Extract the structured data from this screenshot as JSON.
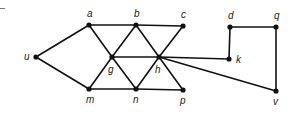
{
  "diagram": {
    "type": "graph",
    "nodes": [
      {
        "id": "u",
        "label": "u",
        "x": 36,
        "y": 57,
        "lx": 24,
        "ly": 60
      },
      {
        "id": "a",
        "label": "a",
        "x": 89,
        "y": 25,
        "lx": 87,
        "ly": 17
      },
      {
        "id": "b",
        "label": "b",
        "x": 136,
        "y": 25,
        "lx": 134,
        "ly": 17
      },
      {
        "id": "c",
        "label": "c",
        "x": 183,
        "y": 26,
        "lx": 181,
        "ly": 18
      },
      {
        "id": "d",
        "label": "d",
        "x": 230,
        "y": 27,
        "lx": 228,
        "ly": 19
      },
      {
        "id": "q",
        "label": "q",
        "x": 276,
        "y": 27,
        "lx": 274,
        "ly": 19
      },
      {
        "id": "g",
        "label": "g",
        "x": 112,
        "y": 57,
        "lx": 108,
        "ly": 73
      },
      {
        "id": "h",
        "label": "h",
        "x": 159,
        "y": 57,
        "lx": 155,
        "ly": 73
      },
      {
        "id": "k",
        "label": "k",
        "x": 229,
        "y": 59,
        "lx": 236,
        "ly": 63
      },
      {
        "id": "m",
        "label": "m",
        "x": 89,
        "y": 89,
        "lx": 86,
        "ly": 103
      },
      {
        "id": "n",
        "label": "n",
        "x": 136,
        "y": 89,
        "lx": 133,
        "ly": 103
      },
      {
        "id": "p",
        "label": "p",
        "x": 183,
        "y": 90,
        "lx": 180,
        "ly": 104
      },
      {
        "id": "v",
        "label": "v",
        "x": 276,
        "y": 91,
        "lx": 273,
        "ly": 105
      }
    ],
    "edges": [
      [
        "u",
        "a"
      ],
      [
        "u",
        "m"
      ],
      [
        "a",
        "b"
      ],
      [
        "b",
        "c"
      ],
      [
        "m",
        "n"
      ],
      [
        "n",
        "p"
      ],
      [
        "a",
        "g"
      ],
      [
        "g",
        "m"
      ],
      [
        "b",
        "g"
      ],
      [
        "g",
        "n"
      ],
      [
        "b",
        "h"
      ],
      [
        "h",
        "n"
      ],
      [
        "c",
        "h"
      ],
      [
        "h",
        "p"
      ],
      [
        "g",
        "h"
      ],
      [
        "h",
        "k"
      ],
      [
        "h",
        "v"
      ],
      [
        "d",
        "k"
      ],
      [
        "d",
        "q"
      ],
      [
        "q",
        "v"
      ]
    ]
  }
}
